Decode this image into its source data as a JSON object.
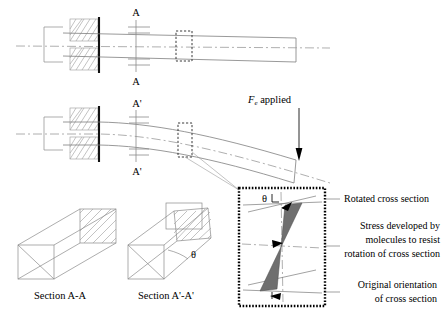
{
  "figure": {
    "labels": {
      "cut_a_top": "A",
      "cut_a_bottom": "A",
      "cut_aprime_top": "A'",
      "cut_aprime_bottom": "A'",
      "force_symbol": "F",
      "force_subscript": "e",
      "force_applied": " applied",
      "theta_detail": "θ",
      "theta_section": "θ",
      "section_aa": "Section A-A",
      "section_aprime": "Section A'-A'"
    },
    "annotations": [
      {
        "id": "rotated",
        "lines": [
          "Rotated cross section"
        ]
      },
      {
        "id": "stress",
        "lines": [
          "Stress developed by",
          "molecules to resist",
          "rotation of cross section"
        ]
      },
      {
        "id": "original",
        "lines": [
          "Original orientation",
          "of cross section"
        ]
      }
    ],
    "colors": {
      "background": "#ffffff",
      "line": "#8a8a8a",
      "wall": "#111111",
      "stress_fill": "#6f6f6f",
      "detail_border": "#000000",
      "text": "#000000"
    }
  }
}
